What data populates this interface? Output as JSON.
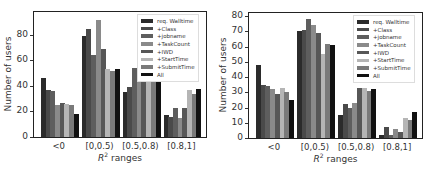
{
  "chart_data": [
    {
      "type": "bar",
      "title": "",
      "xlabel": "R^2 ranges",
      "ylabel": "Number of users",
      "categories": [
        "<0",
        "[0,0.5)",
        "[0.5,0.8)",
        "[0.8,1]"
      ],
      "yticks": [
        0,
        20,
        40,
        60,
        80
      ],
      "ylim": [
        0,
        98
      ],
      "legend_position": "upper right",
      "series": [
        {
          "name": "req. Walltime",
          "color": "#2b2b2b",
          "values": [
            46,
            79,
            35,
            17
          ]
        },
        {
          "name": "+Class",
          "color": "#4a4a4a",
          "values": [
            37,
            85,
            39,
            16
          ]
        },
        {
          "name": "+jobname",
          "color": "#5e5e5e",
          "values": [
            36,
            64,
            54,
            23
          ]
        },
        {
          "name": "+TaskCount",
          "color": "#8a8a8a",
          "values": [
            25,
            92,
            45,
            15
          ]
        },
        {
          "name": "+IWD",
          "color": "#575757",
          "values": [
            27,
            69,
            57,
            23
          ]
        },
        {
          "name": "+StartTime",
          "color": "#b5b5b5",
          "values": [
            26,
            53,
            60,
            37
          ]
        },
        {
          "name": "+SubmitTime",
          "color": "#7a7a7a",
          "values": [
            25,
            52,
            65,
            34
          ]
        },
        {
          "name": "All",
          "color": "#111111",
          "values": [
            18,
            53,
            67,
            38
          ]
        }
      ]
    },
    {
      "type": "bar",
      "title": "",
      "xlabel": "R^2 ranges",
      "ylabel": "Number of users",
      "categories": [
        "<0",
        "[0,0.5)",
        "[0.5,0.8)",
        "[0.8,1]"
      ],
      "yticks": [
        0,
        10,
        20,
        30,
        40,
        50,
        60,
        70,
        80
      ],
      "ylim": [
        0,
        82
      ],
      "legend_position": "upper right",
      "series": [
        {
          "name": "req. Walltime",
          "color": "#2b2b2b",
          "values": [
            48,
            70,
            15,
            2
          ]
        },
        {
          "name": "+Class",
          "color": "#4a4a4a",
          "values": [
            35,
            71,
            22,
            7
          ]
        },
        {
          "name": "+jobname",
          "color": "#5e5e5e",
          "values": [
            34,
            78,
            20,
            2
          ]
        },
        {
          "name": "+TaskCount",
          "color": "#8a8a8a",
          "values": [
            32,
            74,
            23,
            6
          ]
        },
        {
          "name": "+IWD",
          "color": "#575757",
          "values": [
            29,
            69,
            33,
            4
          ]
        },
        {
          "name": "+StartTime",
          "color": "#b5b5b5",
          "values": [
            33,
            55,
            33,
            13
          ]
        },
        {
          "name": "+SubmitTime",
          "color": "#7a7a7a",
          "values": [
            30,
            62,
            31,
            12
          ]
        },
        {
          "name": "All",
          "color": "#111111",
          "values": [
            25,
            61,
            32,
            17
          ]
        }
      ]
    }
  ],
  "charts": [
    {
      "ylabel": "Number of users",
      "xlabel": "R² ranges"
    },
    {
      "ylabel": "Number of users",
      "xlabel": "R² ranges"
    }
  ]
}
